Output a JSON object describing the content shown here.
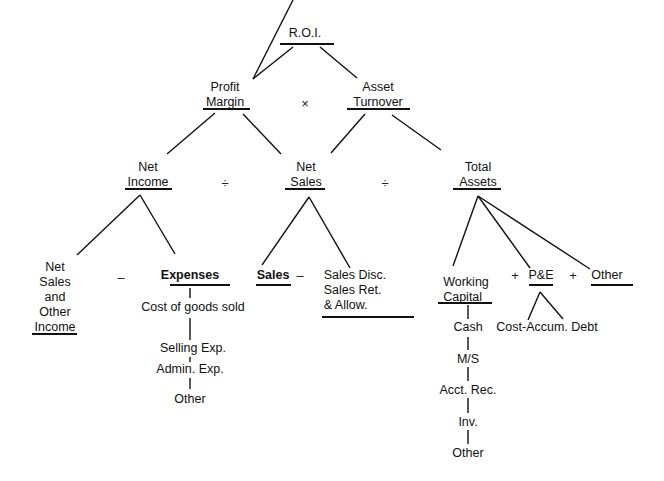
{
  "title": "R.O.I.",
  "level1": {
    "left": {
      "line1": "Profit",
      "line2": "Margin"
    },
    "operator": "×",
    "right": {
      "line1": "Asset",
      "line2": "Turnover"
    }
  },
  "level2": {
    "net_income": {
      "line1": "Net",
      "line2": "Income"
    },
    "op1": "÷",
    "net_sales": {
      "line1": "Net",
      "line2": "Sales"
    },
    "op2": "÷",
    "total_assets": {
      "line1": "Total",
      "line2": "Assets"
    }
  },
  "level3": {
    "net_sales_other_income": [
      "Net",
      "Sales",
      "and",
      "Other",
      "Income"
    ],
    "minus1": "–",
    "expenses": "Expenses",
    "expense_items": [
      "Cost of goods sold",
      "Selling Exp.",
      "Admin. Exp.",
      "Other"
    ],
    "sales": "Sales",
    "minus2": "–",
    "sales_deductions": [
      "Sales Disc.",
      "Sales Ret.",
      "& Allow."
    ],
    "working_capital": {
      "line1": "Working",
      "line2": "Capital"
    },
    "working_capital_items": [
      "Cash",
      "M/S",
      "Acct. Rec.",
      "Inv.",
      "Other"
    ],
    "plus1": "+",
    "pe": "P&E",
    "pe_detail": "Cost-Accum. Debt",
    "plus2": "+",
    "other": "Other"
  }
}
